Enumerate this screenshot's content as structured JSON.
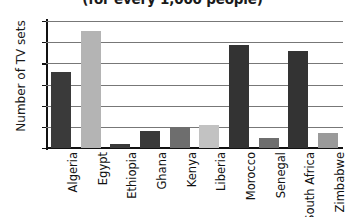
{
  "chart_data": {
    "type": "bar",
    "title": "(for every 1,000 people)",
    "title_note": "top line of heading is cropped off above the image edge",
    "xlabel": "",
    "ylabel": "Number of TV sets",
    "ylim": [
      0,
      120
    ],
    "ytick_labels": [
      "0",
      "20",
      "40",
      "60",
      "80",
      "100",
      "120"
    ],
    "ytick_values": [
      0,
      20,
      40,
      60,
      80,
      100,
      120
    ],
    "grid": true,
    "legend": "none",
    "categories": [
      "Algeria",
      "Egypt",
      "Ethiopia",
      "Ghana",
      "Kenya",
      "Liberia",
      "Morocco",
      "Senegal",
      "South Africa",
      "Zimbabwe"
    ],
    "values": [
      72,
      111,
      4,
      16,
      20,
      22,
      97,
      9,
      92,
      14
    ],
    "bar_colors": [
      "#3a3a3a",
      "#b4b4b4",
      "#3a3a3a",
      "#3a3a3a",
      "#6e6e6e",
      "#c2c2c2",
      "#333333",
      "#6e6e6e",
      "#333333",
      "#9a9a9a"
    ],
    "bars": [
      {
        "category": "Algeria",
        "value": 72,
        "color": "#3a3a3a"
      },
      {
        "category": "Egypt",
        "value": 111,
        "color": "#b4b4b4"
      },
      {
        "category": "Ethiopia",
        "value": 4,
        "color": "#3a3a3a"
      },
      {
        "category": "Ghana",
        "value": 16,
        "color": "#3a3a3a"
      },
      {
        "category": "Kenya",
        "value": 20,
        "color": "#6e6e6e"
      },
      {
        "category": "Liberia",
        "value": 22,
        "color": "#c2c2c2"
      },
      {
        "category": "Morocco",
        "value": 97,
        "color": "#333333"
      },
      {
        "category": "Senegal",
        "value": 9,
        "color": "#6e6e6e"
      },
      {
        "category": "South Africa",
        "value": 92,
        "color": "#333333"
      },
      {
        "category": "Zimbabwe",
        "value": 14,
        "color": "#9a9a9a"
      }
    ]
  },
  "colors": {
    "axis": "#111111",
    "gridline": "#777777",
    "background": "#ffffff",
    "text": "#1a1a1a"
  }
}
